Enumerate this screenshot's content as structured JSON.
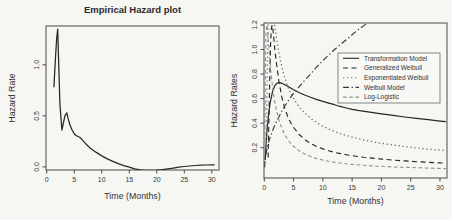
{
  "page": {
    "background": "#f6f6f3"
  },
  "chart_data": [
    {
      "type": "line",
      "title": "Empirical Hazard plot",
      "xlabel": "Time (Months)",
      "ylabel": "Hazard Rate",
      "xlim": [
        -0.13,
        31.3
      ],
      "ylim": [
        -0.03,
        1.38
      ],
      "x_ticks": [
        0,
        5,
        10,
        15,
        20,
        25,
        30
      ],
      "y_ticks": [
        0.0,
        0.5,
        1.0
      ],
      "y_tick_labels": [
        "0.0",
        "0.5",
        "1.0"
      ],
      "grid": false,
      "legend": null,
      "series": [
        {
          "name": "Empirical hazard",
          "line_style": "solid",
          "color": "#262626",
          "width": 1.25,
          "points": [
            [
              1.3,
              0.78
            ],
            [
              1.55,
              1.02
            ],
            [
              1.8,
              1.25
            ],
            [
              2.0,
              1.35
            ],
            [
              2.15,
              1.08
            ],
            [
              2.4,
              0.62
            ],
            [
              2.75,
              0.36
            ],
            [
              3.0,
              0.42
            ],
            [
              3.3,
              0.5
            ],
            [
              3.65,
              0.53
            ],
            [
              3.9,
              0.47
            ],
            [
              4.2,
              0.415
            ],
            [
              4.6,
              0.365
            ],
            [
              5.0,
              0.325
            ],
            [
              5.4,
              0.305
            ],
            [
              6.0,
              0.29
            ],
            [
              6.5,
              0.263
            ],
            [
              7.0,
              0.232
            ],
            [
              7.5,
              0.205
            ],
            [
              8,
              0.18
            ],
            [
              9,
              0.142
            ],
            [
              10,
              0.108
            ],
            [
              11,
              0.079
            ],
            [
              12,
              0.054
            ],
            [
              13,
              0.032
            ],
            [
              14,
              0.013
            ],
            [
              15,
              -0.003
            ],
            [
              16,
              -0.018
            ],
            [
              17,
              -0.028
            ],
            [
              18,
              -0.033
            ],
            [
              19,
              -0.034
            ],
            [
              20,
              -0.031
            ],
            [
              21,
              -0.026
            ],
            [
              22,
              -0.019
            ],
            [
              23,
              -0.011
            ],
            [
              24,
              -0.003
            ],
            [
              25,
              0.004
            ],
            [
              26,
              0.009
            ],
            [
              27,
              0.014
            ],
            [
              28,
              0.017
            ],
            [
              29,
              0.019
            ],
            [
              30,
              0.021
            ],
            [
              30.5,
              0.021
            ]
          ]
        }
      ]
    },
    {
      "type": "line",
      "title": "",
      "xlabel": "Time (Months)",
      "ylabel": "Hazard Rates",
      "xlim": [
        -0.05,
        31.2
      ],
      "ylim": [
        -0.047,
        1.216
      ],
      "x_ticks": [
        0,
        5,
        10,
        15,
        20,
        25,
        30
      ],
      "y_ticks": [
        0.2,
        0.4,
        0.6,
        0.8,
        1.0,
        1.2
      ],
      "y_tick_labels": [
        "0.2",
        "0.4",
        "0.6",
        "0.8",
        "1.0",
        "1.2"
      ],
      "grid": false,
      "legend": {
        "position": "upper-right-inside",
        "entries": [
          {
            "label": "Transformation Model",
            "line_style": "solid",
            "color": "#262626"
          },
          {
            "label": "Generalized Weibull",
            "line_style": "dashed",
            "color": "#262626"
          },
          {
            "label": "Exponentiated Weibull",
            "line_style": "dotted",
            "color": "#6e6e6e"
          },
          {
            "label": "Weibull Model",
            "line_style": "dashdot",
            "color": "#3a3a3a"
          },
          {
            "label": "Log-Logistic",
            "line_style": "shortdash",
            "color": "#8f8f8f"
          }
        ]
      },
      "series": [
        {
          "name": "Transformation Model",
          "line_style": "solid",
          "color": "#262626",
          "width": 1.2,
          "points": [
            [
              0.15,
              0.1
            ],
            [
              0.4,
              0.3
            ],
            [
              0.7,
              0.46
            ],
            [
              1.0,
              0.565
            ],
            [
              1.4,
              0.655
            ],
            [
              1.8,
              0.705
            ],
            [
              2.2,
              0.727
            ],
            [
              2.6,
              0.73
            ],
            [
              3.0,
              0.725
            ],
            [
              3.5,
              0.713
            ],
            [
              4,
              0.7
            ],
            [
              5,
              0.672
            ],
            [
              6,
              0.648
            ],
            [
              7,
              0.627
            ],
            [
              8,
              0.609
            ],
            [
              9,
              0.592
            ],
            [
              10,
              0.577
            ],
            [
              11,
              0.563
            ],
            [
              12,
              0.55
            ],
            [
              12.8,
              0.538
            ],
            [
              14,
              0.523
            ],
            [
              15,
              0.513
            ],
            [
              16,
              0.504
            ],
            [
              18,
              0.49
            ],
            [
              20,
              0.476
            ],
            [
              22,
              0.463
            ],
            [
              24,
              0.45
            ],
            [
              26,
              0.439
            ],
            [
              28,
              0.428
            ],
            [
              30,
              0.417
            ],
            [
              31,
              0.412
            ]
          ]
        },
        {
          "name": "Generalized Weibull",
          "line_style": "dashed",
          "color": "#262626",
          "width": 1.15,
          "points": [
            [
              0.65,
              0.12
            ],
            [
              0.75,
              0.35
            ],
            [
              0.9,
              0.7
            ],
            [
              1.05,
              1.0
            ],
            [
              1.2,
              1.17
            ],
            [
              1.35,
              1.2
            ],
            [
              1.55,
              1.13
            ],
            [
              1.8,
              1.0
            ],
            [
              2.1,
              0.88
            ],
            [
              2.5,
              0.74
            ],
            [
              3,
              0.61
            ],
            [
              3.5,
              0.52
            ],
            [
              4,
              0.455
            ],
            [
              4.5,
              0.405
            ],
            [
              5,
              0.365
            ],
            [
              6,
              0.305
            ],
            [
              7,
              0.263
            ],
            [
              8,
              0.232
            ],
            [
              9,
              0.208
            ],
            [
              10,
              0.19
            ],
            [
              11,
              0.175
            ],
            [
              12,
              0.162
            ],
            [
              13,
              0.152
            ],
            [
              14,
              0.143
            ],
            [
              15,
              0.135
            ],
            [
              16,
              0.128
            ],
            [
              17,
              0.122
            ],
            [
              18,
              0.117
            ],
            [
              19,
              0.112
            ],
            [
              20,
              0.107
            ],
            [
              22,
              0.099
            ],
            [
              24,
              0.092
            ],
            [
              26,
              0.086
            ],
            [
              28,
              0.081
            ],
            [
              30,
              0.076
            ],
            [
              31,
              0.074
            ]
          ]
        },
        {
          "name": "Exponentiated Weibull",
          "line_style": "dotted",
          "color": "#6e6e6e",
          "width": 1.3,
          "points": [
            [
              0.35,
              0.15
            ],
            [
              0.45,
              0.55
            ],
            [
              0.55,
              0.95
            ],
            [
              0.65,
              1.18
            ],
            [
              0.8,
              1.3
            ],
            [
              1.0,
              1.34
            ],
            [
              1.3,
              1.32
            ],
            [
              1.6,
              1.25
            ],
            [
              2.0,
              1.12
            ],
            [
              2.4,
              1.0
            ],
            [
              2.8,
              0.9
            ],
            [
              3.2,
              0.82
            ],
            [
              3.6,
              0.755
            ],
            [
              4,
              0.7
            ],
            [
              4.5,
              0.645
            ],
            [
              5,
              0.6
            ],
            [
              5.5,
              0.563
            ],
            [
              6,
              0.53
            ],
            [
              7,
              0.478
            ],
            [
              8,
              0.437
            ],
            [
              9,
              0.403
            ],
            [
              10,
              0.375
            ],
            [
              11,
              0.352
            ],
            [
              12,
              0.332
            ],
            [
              13,
              0.314
            ],
            [
              14,
              0.299
            ],
            [
              15,
              0.286
            ],
            [
              16,
              0.274
            ],
            [
              17,
              0.263
            ],
            [
              18,
              0.253
            ],
            [
              19,
              0.244
            ],
            [
              20,
              0.236
            ],
            [
              22,
              0.222
            ],
            [
              24,
              0.209
            ],
            [
              26,
              0.198
            ],
            [
              28,
              0.188
            ],
            [
              30,
              0.18
            ],
            [
              31,
              0.176
            ]
          ]
        },
        {
          "name": "Weibull Model",
          "line_style": "dashdot",
          "color": "#3a3a3a",
          "width": 1.15,
          "points": [
            [
              0.05,
              0.04
            ],
            [
              0.2,
              0.13
            ],
            [
              0.5,
              0.2
            ],
            [
              1,
              0.285
            ],
            [
              1.5,
              0.35
            ],
            [
              2,
              0.405
            ],
            [
              2.5,
              0.45
            ],
            [
              3,
              0.5
            ],
            [
              3.5,
              0.54
            ],
            [
              4,
              0.575
            ],
            [
              5,
              0.645
            ],
            [
              6,
              0.7
            ],
            [
              7,
              0.755
            ],
            [
              8,
              0.805
            ],
            [
              9,
              0.86
            ],
            [
              10,
              0.91
            ],
            [
              11,
              0.955
            ],
            [
              12,
              1.0
            ],
            [
              13,
              1.04
            ],
            [
              14,
              1.08
            ],
            [
              15,
              1.12
            ],
            [
              16,
              1.16
            ],
            [
              17,
              1.195
            ],
            [
              18,
              1.23
            ],
            [
              19,
              1.265
            ],
            [
              20,
              1.3
            ]
          ]
        },
        {
          "name": "Log-Logistic",
          "line_style": "shortdash",
          "color": "#8f8f8f",
          "width": 1.1,
          "points": [
            [
              0.1,
              0.25
            ],
            [
              0.15,
              0.6
            ],
            [
              0.2,
              0.9
            ],
            [
              0.3,
              1.13
            ],
            [
              0.4,
              1.2
            ],
            [
              0.55,
              1.17
            ],
            [
              0.7,
              1.08
            ],
            [
              0.9,
              0.95
            ],
            [
              1.1,
              0.83
            ],
            [
              1.4,
              0.7
            ],
            [
              1.7,
              0.6
            ],
            [
              2,
              0.52
            ],
            [
              2.5,
              0.425
            ],
            [
              3,
              0.357
            ],
            [
              3.5,
              0.306
            ],
            [
              4,
              0.267
            ],
            [
              4.5,
              0.236
            ],
            [
              5,
              0.211
            ],
            [
              6,
              0.173
            ],
            [
              7,
              0.146
            ],
            [
              8,
              0.126
            ],
            [
              9,
              0.111
            ],
            [
              10,
              0.099
            ],
            [
              11,
              0.089
            ],
            [
              12,
              0.081
            ],
            [
              13,
              0.075
            ],
            [
              14,
              0.069
            ],
            [
              15,
              0.064
            ],
            [
              16,
              0.06
            ],
            [
              17,
              0.057
            ],
            [
              18,
              0.053
            ],
            [
              19,
              0.05
            ],
            [
              20,
              0.048
            ],
            [
              22,
              0.043
            ],
            [
              24,
              0.04
            ],
            [
              26,
              0.037
            ],
            [
              28,
              0.034
            ],
            [
              30,
              0.031
            ],
            [
              31,
              0.03
            ]
          ]
        }
      ]
    }
  ]
}
